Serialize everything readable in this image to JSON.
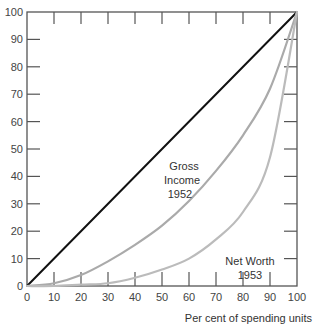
{
  "chart_data": {
    "type": "line",
    "title": "",
    "xlabel": "Per cent of spending units",
    "ylabel": "",
    "xlim": [
      0,
      100
    ],
    "ylim": [
      0,
      100
    ],
    "x_ticks": [
      "0",
      "10",
      "20",
      "30",
      "40",
      "50",
      "60",
      "70",
      "80",
      "90",
      "100"
    ],
    "y_ticks": [
      "0",
      "10",
      "20",
      "30",
      "40",
      "50",
      "60",
      "70",
      "80",
      "90",
      "100"
    ],
    "grid": false,
    "legend": "none (inline annotations)",
    "series": [
      {
        "name": "Line of equality",
        "color": "#111111",
        "x": [
          0,
          100
        ],
        "y": [
          0,
          100
        ]
      },
      {
        "name": "Gross Income 1952",
        "color": "#aaaaaa",
        "x": [
          0,
          10,
          20,
          30,
          40,
          50,
          60,
          70,
          80,
          90,
          100
        ],
        "y": [
          0,
          1,
          4,
          9,
          15,
          22,
          31,
          42,
          55,
          72,
          100
        ]
      },
      {
        "name": "Net Worth 1953",
        "color": "#bbbbbb",
        "x": [
          0,
          10,
          20,
          30,
          40,
          50,
          60,
          70,
          80,
          90,
          100
        ],
        "y": [
          0,
          0,
          0.5,
          1,
          3,
          6,
          10,
          17,
          27,
          47,
          100
        ]
      }
    ],
    "annotations": [
      {
        "text": [
          "Gross",
          "Income",
          "1952"
        ],
        "x": 50,
        "y": 50
      },
      {
        "text": [
          "Net Worth",
          "1953"
        ],
        "x": 80,
        "y": 16
      }
    ]
  },
  "labels": {
    "gross": [
      "Gross",
      "Income",
      "1952"
    ],
    "net": [
      "Net Worth",
      "1953"
    ],
    "xlabel": "Per cent of spending units"
  }
}
